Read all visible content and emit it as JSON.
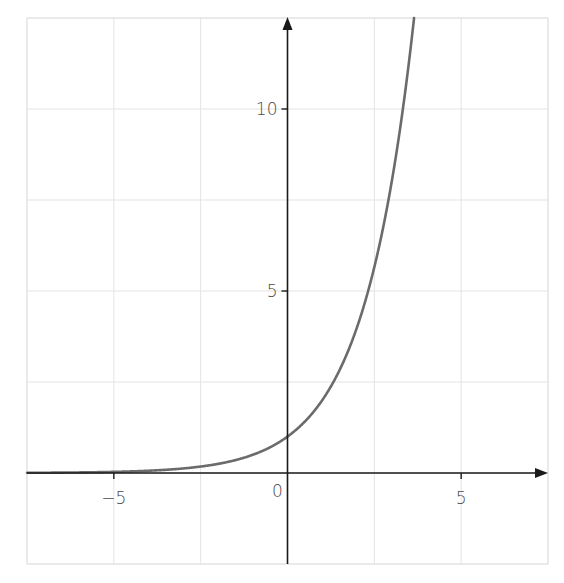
{
  "chart_data": {
    "type": "line",
    "title": "",
    "xlabel": "",
    "ylabel": "",
    "function": "y = 2^x",
    "xlim": [
      -7.5,
      7.5
    ],
    "ylim": [
      -2.5,
      12.5
    ],
    "grid": true,
    "grid_step": 2.5,
    "legend": null,
    "x_ticks": [
      {
        "value": -5,
        "label": "−5"
      },
      {
        "value": 5,
        "label": "5"
      }
    ],
    "y_ticks": [
      {
        "value": 5,
        "label": "5"
      },
      {
        "value": 10,
        "label": "10"
      }
    ],
    "origin_label": "0",
    "series": [
      {
        "name": "2^x",
        "x": [
          -7.5,
          -7,
          -6,
          -5,
          -4,
          -3,
          -2,
          -1,
          0,
          1,
          2,
          2.32,
          3,
          3.5,
          3.64
        ],
        "values": [
          0.0055,
          0.0078,
          0.0156,
          0.03125,
          0.0625,
          0.125,
          0.25,
          0.5,
          1,
          2,
          4,
          5,
          8,
          11.31,
          12.47
        ]
      }
    ]
  },
  "style": {
    "curve_color": "#6b6b6b",
    "axis_color": "#1a1a1a",
    "grid_color": "#e3e3e3",
    "frame_color": "#e3e3e3",
    "label_color": "#4a4a4a"
  },
  "layout": {
    "plot_left": 27,
    "plot_right": 548,
    "plot_top": 18,
    "plot_bottom": 564
  }
}
